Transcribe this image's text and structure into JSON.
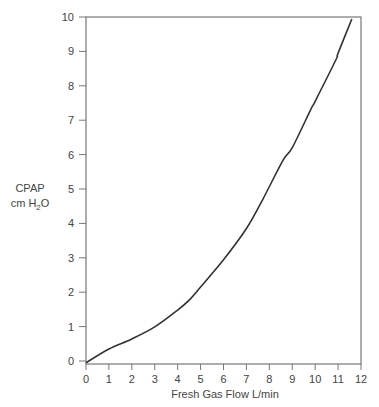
{
  "chart_data": {
    "type": "line",
    "title": "",
    "xlabel": "Fresh Gas Flow L/min",
    "ylabel": "CPAP cm H2O",
    "ylabel_lines": [
      "CPAP",
      "cm H",
      "2",
      "O"
    ],
    "xlim": [
      0,
      12
    ],
    "ylim": [
      0,
      10
    ],
    "xticks": [
      0,
      1,
      2,
      3,
      4,
      5,
      6,
      7,
      8,
      9,
      10,
      11,
      12
    ],
    "yticks": [
      0,
      1,
      2,
      3,
      4,
      5,
      6,
      7,
      8,
      9,
      10
    ],
    "grid": false,
    "legend": null,
    "series": [
      {
        "name": "CPAP vs Fresh Gas Flow",
        "color": "#333333",
        "x": [
          0,
          1,
          2,
          3,
          4,
          4.5,
          5,
          6,
          7,
          7.7,
          8.6,
          9,
          9.8,
          10,
          10.9,
          11,
          11.6
        ],
        "y": [
          -0.05,
          0.35,
          0.64,
          0.99,
          1.48,
          1.77,
          2.15,
          2.94,
          3.85,
          4.68,
          5.84,
          6.2,
          7.3,
          7.55,
          8.75,
          8.95,
          9.94
        ]
      }
    ]
  }
}
